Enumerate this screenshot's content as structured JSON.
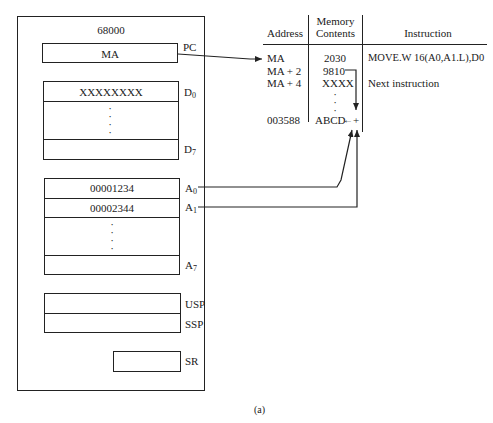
{
  "cpu": {
    "title": "68000",
    "pc": {
      "label": "PC",
      "value": "MA"
    },
    "data_registers": {
      "d0": {
        "label": "D",
        "sub": "0",
        "value": "XXXXXXXX"
      },
      "d7": {
        "label": "D",
        "sub": "7",
        "value": ""
      },
      "ellipsis": "⋮"
    },
    "address_registers": {
      "a0": {
        "label": "A",
        "sub": "0",
        "value": "00001234"
      },
      "a1": {
        "label": "A",
        "sub": "1",
        "value": "00002344"
      },
      "a7": {
        "label": "A",
        "sub": "7",
        "value": ""
      },
      "ellipsis": "⋮"
    },
    "usp": {
      "label": "USP",
      "value": ""
    },
    "ssp": {
      "label": "SSP",
      "value": ""
    },
    "sr": {
      "label": "SR",
      "value": ""
    }
  },
  "memory_table": {
    "headers": {
      "address": "Address",
      "contents_line1": "Memory",
      "contents_line2": "Contents",
      "instruction": "Instruction"
    },
    "rows": [
      {
        "address": "MA",
        "contents": "2030",
        "instruction": "MOVE.W 16(A0,A1.L),D0"
      },
      {
        "address": "MA + 2",
        "contents": "9810",
        "instruction": ""
      },
      {
        "address": "MA + 4",
        "contents": "XXXX",
        "instruction": "Next instruction"
      },
      {
        "address": "",
        "contents": "⋮",
        "instruction": ""
      },
      {
        "address": "003588",
        "contents": "ABCD",
        "instruction": ""
      }
    ],
    "sum_symbol": "+",
    "result_arrow": "←"
  },
  "caption": "(a)",
  "colors": {
    "ink": "#222222",
    "background": "#ffffff"
  }
}
